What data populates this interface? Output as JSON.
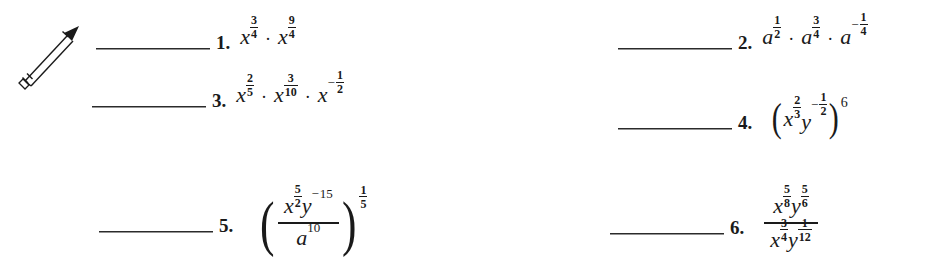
{
  "page": {
    "background_color": "#ffffff",
    "ink_color": "#1a1a1a",
    "icon": "pencil-icon"
  },
  "worksheet": {
    "answer_blank_label": "",
    "problems": [
      {
        "id": "1",
        "number": "1.",
        "expression_text": "x^(3/4) · x^(9/4)",
        "terms": [
          {
            "base": "x",
            "exp_num": "3",
            "exp_den": "4",
            "negative": false
          },
          {
            "base": "x",
            "exp_num": "9",
            "exp_den": "4",
            "negative": false
          }
        ],
        "operator": "·"
      },
      {
        "id": "2",
        "number": "2.",
        "expression_text": "a^(1/2) · a^(3/4) · a^(-1/4)",
        "terms": [
          {
            "base": "a",
            "exp_num": "1",
            "exp_den": "2",
            "negative": false
          },
          {
            "base": "a",
            "exp_num": "3",
            "exp_den": "4",
            "negative": false
          },
          {
            "base": "a",
            "exp_num": "1",
            "exp_den": "4",
            "negative": true
          }
        ],
        "operator": "·"
      },
      {
        "id": "3",
        "number": "3.",
        "expression_text": "x^(2/5) · x^(3/10) · x^(-1/2)",
        "terms": [
          {
            "base": "x",
            "exp_num": "2",
            "exp_den": "5",
            "negative": false
          },
          {
            "base": "x",
            "exp_num": "3",
            "exp_den": "10",
            "negative": false
          },
          {
            "base": "x",
            "exp_num": "1",
            "exp_den": "2",
            "negative": true
          }
        ],
        "operator": "·"
      },
      {
        "id": "4",
        "number": "4.",
        "expression_text": "(x^(2/3) y^(-1/2))^6",
        "inner": [
          {
            "base": "x",
            "exp_num": "2",
            "exp_den": "3",
            "negative": false
          },
          {
            "base": "y",
            "exp_num": "1",
            "exp_den": "2",
            "negative": true
          }
        ],
        "outer_exponent": "6"
      },
      {
        "id": "5",
        "number": "5.",
        "expression_text": "((x^(5/2) y^(-15)) / a^10)^(1/5)",
        "numerator": [
          {
            "base": "x",
            "exp_num": "5",
            "exp_den": "2",
            "negative": false
          },
          {
            "base": "y",
            "exp_int": "15",
            "negative": true
          }
        ],
        "denominator": [
          {
            "base": "a",
            "exp_int": "10",
            "negative": false
          }
        ],
        "outer_exp_num": "1",
        "outer_exp_den": "5"
      },
      {
        "id": "6",
        "number": "6.",
        "expression_text": "(x^(5/8) y^(5/6)) / (x^(3/4) y^(1/12))",
        "numerator": [
          {
            "base": "x",
            "exp_num": "5",
            "exp_den": "8",
            "negative": false
          },
          {
            "base": "y",
            "exp_num": "5",
            "exp_den": "6",
            "negative": false
          }
        ],
        "denominator": [
          {
            "base": "x",
            "exp_num": "3",
            "exp_den": "4",
            "negative": false
          },
          {
            "base": "y",
            "exp_num": "1",
            "exp_den": "12",
            "negative": false
          }
        ]
      }
    ]
  }
}
